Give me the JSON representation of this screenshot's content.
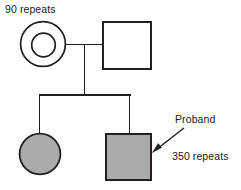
{
  "diagram": {
    "type": "pedigree-chart",
    "colors": {
      "stroke": "#231f20",
      "affected_fill": "#ababab",
      "unaffected_fill": "#ffffff",
      "background": "#ffffff",
      "text": "#1a1a1a"
    },
    "labels": {
      "maternal_repeats": "90 repeats",
      "proband": "Proband",
      "proband_repeats": "350 repeats"
    },
    "individuals": [
      {
        "id": "generation1-mother",
        "sex": "female",
        "shape": "double-circle",
        "status": "premutation-carrier",
        "fill": "#ffffff",
        "repeats": "90 repeats",
        "generation": 1,
        "center": {
          "x": 43,
          "y": 44
        },
        "outer_radius": 23,
        "inner_radius": 12
      },
      {
        "id": "generation1-father",
        "sex": "male",
        "shape": "square",
        "status": "unaffected",
        "fill": "#ffffff",
        "generation": 1,
        "box": {
          "x": 102,
          "y": 21,
          "width": 50,
          "height": 49
        }
      },
      {
        "id": "generation2-daughter",
        "sex": "female",
        "shape": "circle",
        "status": "affected",
        "fill": "#ababab",
        "generation": 2,
        "center": {
          "x": 40,
          "y": 154
        },
        "radius": 21
      },
      {
        "id": "generation2-son-proband",
        "sex": "male",
        "shape": "square",
        "status": "affected",
        "fill": "#ababab",
        "proband": true,
        "repeats": "350 repeats",
        "generation": 2,
        "box": {
          "x": 105,
          "y": 133,
          "width": 47,
          "height": 48
        }
      }
    ],
    "connectors": [
      {
        "id": "mating-line",
        "type": "horizontal",
        "x1": 66,
        "x2": 102,
        "y": 44
      },
      {
        "id": "descent-line",
        "type": "vertical",
        "x": 84,
        "y1": 44,
        "y2": 95
      },
      {
        "id": "sibship-line",
        "type": "horizontal",
        "x1": 39,
        "x2": 130,
        "y": 95
      },
      {
        "id": "sibling-drop-daughter",
        "type": "vertical",
        "x": 39,
        "y1": 95,
        "y2": 133
      },
      {
        "id": "sibling-drop-son",
        "type": "vertical",
        "x": 130,
        "y1": 95,
        "y2": 133
      }
    ],
    "annotations": [
      {
        "id": "proband-arrow",
        "type": "arrow",
        "from": {
          "x": 184,
          "y": 128
        },
        "to": {
          "x": 153,
          "y": 152
        },
        "points_to": "generation2-son-proband"
      }
    ]
  }
}
